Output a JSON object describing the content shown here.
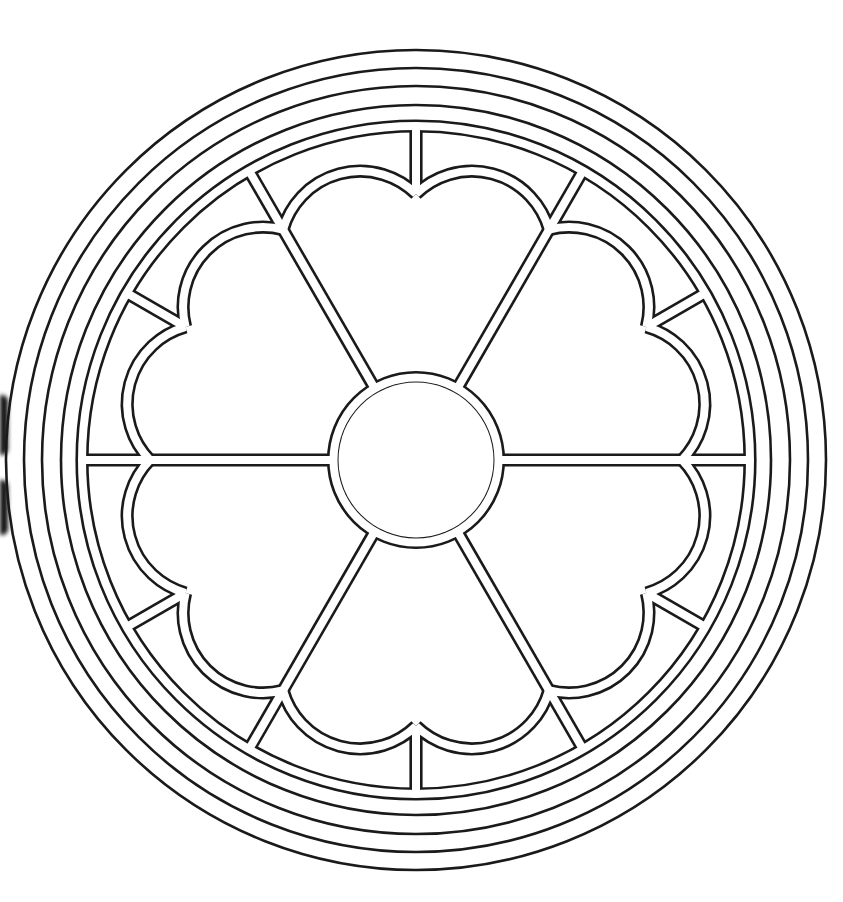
{
  "colors": {
    "background": "#ffffff",
    "line": "#1a1a1a"
  },
  "geometry": {
    "cx": 416,
    "cy": 460,
    "outer_rings": [
      410,
      392,
      374,
      355
    ],
    "inner_ring_outer": 338,
    "inner_ring_inner": 330,
    "hub_outer": 87,
    "hub_inner": 78,
    "spoke_angles_deg": [
      0,
      60,
      120,
      180,
      240,
      300
    ],
    "strut_angles_deg": [
      30,
      90,
      150,
      210,
      270,
      330
    ],
    "lobe_join_radius": 266,
    "lobe_arc_radius": 80,
    "double_line_gap": 8,
    "line_width": 2.6
  },
  "elements": {
    "ring_count": 5,
    "spoke_count": 6,
    "lobe_count": 12,
    "strut_count": 6
  }
}
